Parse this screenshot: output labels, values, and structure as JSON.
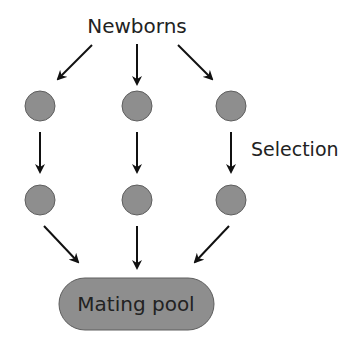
{
  "diagram": {
    "title": "Newborns",
    "side_label": "Selection",
    "pool_label": "Mating pool",
    "colors": {
      "node_fill": "#8e8e8e",
      "node_stroke": "#5e5e5e",
      "arrow": "#111111",
      "text": "#222222"
    },
    "nodes": [
      {
        "row": 1,
        "col": 1
      },
      {
        "row": 1,
        "col": 2
      },
      {
        "row": 1,
        "col": 3
      },
      {
        "row": 2,
        "col": 1
      },
      {
        "row": 2,
        "col": 2
      },
      {
        "row": 2,
        "col": 3
      }
    ]
  }
}
